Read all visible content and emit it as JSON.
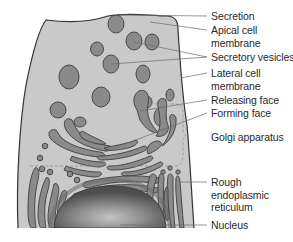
{
  "diagram": {
    "colors": {
      "cytoplasm": "#c9c9c9",
      "organelle_fill": "#8a8a8a",
      "outline": "#3a3a3a",
      "leader_line": "#6a6a6a",
      "label_text": "#2a2a2a",
      "nucleus_dark": "#5a5a5a",
      "nucleus_light": "#bdbdbd"
    },
    "labels": {
      "secretion": "Secretion",
      "apical_line1": "Apical cell",
      "apical_line2": "membrane",
      "secretory_vesicles": "Secretory vesicles",
      "lateral_line1": "Lateral cell",
      "lateral_line2": "membrane",
      "releasing_face": "Releasing face",
      "forming_face": "Forming face",
      "golgi_apparatus": "Golgi apparatus",
      "rer_line1": "Rough",
      "rer_line2": "endoplasmic",
      "rer_line3": "reticulum",
      "nucleus": "Nucleus"
    }
  }
}
